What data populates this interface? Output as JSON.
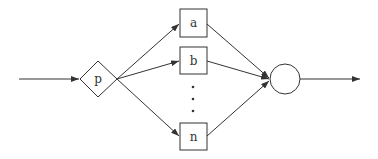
{
  "diagram": {
    "decision_node": {
      "label": "p"
    },
    "process_nodes": [
      {
        "label": "a"
      },
      {
        "label": "b"
      },
      {
        "label": "n"
      }
    ],
    "ellipsis": "⋮",
    "merge_node": {
      "label": ""
    },
    "colors": {
      "stroke": "#333333",
      "background": "#ffffff"
    }
  }
}
